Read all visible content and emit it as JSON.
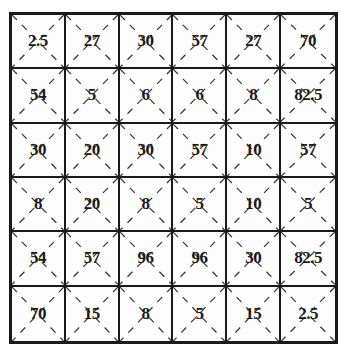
{
  "grid": {
    "rows": 6,
    "cols": 6,
    "cells": [
      [
        "2.5",
        "27",
        "30",
        "57",
        "27",
        "70"
      ],
      [
        "54",
        "5",
        "6",
        "6",
        "8",
        "82.5"
      ],
      [
        "30",
        "20",
        "30",
        "57",
        "10",
        "57"
      ],
      [
        "8",
        "20",
        "8",
        "5",
        "10",
        "5"
      ],
      [
        "54",
        "57",
        "96",
        "96",
        "30",
        "82.5"
      ],
      [
        "70",
        "15",
        "8",
        "5",
        "15",
        "2.5"
      ]
    ],
    "cell_decoration": "dashed-diagonal-cross",
    "colors": {
      "line": "#1a1a1a",
      "dash": "#333333",
      "background": "#ffffff"
    }
  }
}
